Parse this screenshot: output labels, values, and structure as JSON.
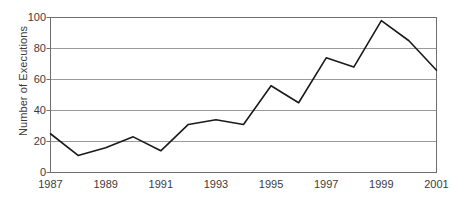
{
  "chart_data": {
    "type": "line",
    "title": "",
    "xlabel": "",
    "ylabel": "Number of Executions",
    "x": [
      1987,
      1988,
      1989,
      1990,
      1991,
      1992,
      1993,
      1994,
      1995,
      1996,
      1997,
      1998,
      1999,
      2000,
      2001
    ],
    "values": [
      25,
      11,
      16,
      23,
      14,
      31,
      34,
      31,
      56,
      45,
      74,
      68,
      98,
      85,
      66
    ],
    "series": [
      {
        "name": "Number of Executions",
        "values": [
          25,
          11,
          16,
          23,
          14,
          31,
          34,
          31,
          56,
          45,
          74,
          68,
          98,
          85,
          66
        ]
      }
    ],
    "xlim": [
      1987,
      2001
    ],
    "ylim": [
      0,
      100
    ],
    "y_ticks": [
      0,
      20,
      40,
      60,
      80,
      100
    ],
    "y_tick_labels": [
      "0",
      "20",
      "40",
      "60",
      "80",
      "100"
    ],
    "x_ticks": [
      1987,
      1989,
      1991,
      1993,
      1995,
      1997,
      1999,
      2001
    ],
    "x_tick_labels": [
      "1987",
      "1989",
      "1991",
      "1993",
      "1995",
      "1997",
      "1999",
      "2001"
    ],
    "grid": "horizontal",
    "legend": "none",
    "line_color": "#1a1a1a",
    "grid_color": "#9a9a9a",
    "axis_color": "#6e6e6e",
    "background_color": "#ffffff"
  }
}
